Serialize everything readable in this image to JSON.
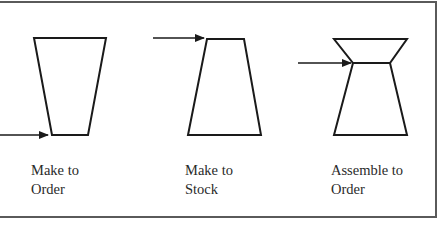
{
  "diagram": {
    "type": "production-strategy-shapes",
    "items": [
      {
        "id": "make-to-order",
        "label_line1": "Make to",
        "label_line2": "Order",
        "shape": "inverted-trapezoid",
        "arrow_position": "bottom"
      },
      {
        "id": "make-to-stock",
        "label_line1": "Make to",
        "label_line2": "Stock",
        "shape": "trapezoid",
        "arrow_position": "top"
      },
      {
        "id": "assemble-to-order",
        "label_line1": "Assemble to",
        "label_line2": "Order",
        "shape": "hourglass",
        "arrow_position": "waist"
      }
    ],
    "colors": {
      "stroke": "#1a1a1a",
      "border": "#5a5a5a",
      "text": "#2a2a2a",
      "background": "#ffffff"
    }
  }
}
